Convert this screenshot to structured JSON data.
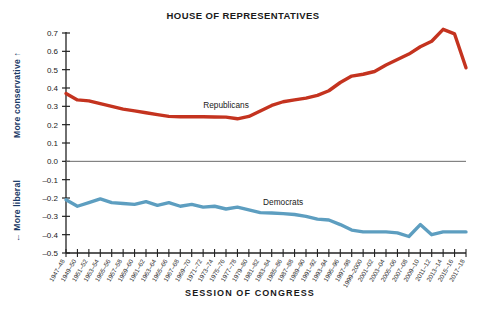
{
  "chart_data": {
    "type": "line",
    "title": "HOUSE OF REPRESENTATIVES",
    "xlabel": "SESSION OF CONGRESS",
    "ylabel_top": "More conservative ↑",
    "ylabel_bottom": "← More liberal",
    "ylim": [
      -0.5,
      0.7
    ],
    "ytick_labels": [
      "0.7",
      "0.6",
      "0.5",
      "0.4",
      "0.3",
      "0.2",
      "0.1",
      "0.0",
      "–0.1",
      "–0.2",
      "–0.3",
      "–0.4",
      "–0.5"
    ],
    "yticks": [
      0.7,
      0.6,
      0.5,
      0.4,
      0.3,
      0.2,
      0.1,
      0.0,
      -0.1,
      -0.2,
      -0.3,
      -0.4,
      -0.5
    ],
    "grid": false,
    "zero_line": true,
    "legend_position": "inline-annotation",
    "categories": [
      "1947–48",
      "1949–50",
      "1951–52",
      "1953–54",
      "1955–56",
      "1957–58",
      "1959–60",
      "1961–62",
      "1963–64",
      "1965–66",
      "1967–68",
      "1969–70",
      "1971–72",
      "1973–74",
      "1975–76",
      "1977–78",
      "1979–80",
      "1981–82",
      "1983–84",
      "1985–86",
      "1987–88",
      "1989–90",
      "1991–92",
      "1993–94",
      "1995–96",
      "1997–98",
      "1999–2000",
      "2001–02",
      "2003–04",
      "2005–06",
      "2007–08",
      "2009–10",
      "2011–12",
      "2013–14",
      "2015–16",
      "2017–18"
    ],
    "series": [
      {
        "name": "Republicans",
        "color": "#C4331F",
        "values": [
          0.37,
          0.335,
          0.33,
          0.315,
          0.3,
          0.285,
          0.275,
          0.265,
          0.255,
          0.245,
          0.243,
          0.243,
          0.243,
          0.242,
          0.241,
          0.232,
          0.245,
          0.275,
          0.305,
          0.325,
          0.335,
          0.345,
          0.36,
          0.385,
          0.43,
          0.465,
          0.475,
          0.49,
          0.525,
          0.555,
          0.585,
          0.625,
          0.655,
          0.72,
          0.695,
          0.51
        ]
      },
      {
        "name": "Democrats",
        "color": "#5D9EC0",
        "values": [
          -0.21,
          -0.245,
          -0.225,
          -0.205,
          -0.225,
          -0.23,
          -0.235,
          -0.22,
          -0.24,
          -0.225,
          -0.245,
          -0.235,
          -0.25,
          -0.245,
          -0.26,
          -0.25,
          -0.265,
          -0.28,
          -0.282,
          -0.285,
          -0.29,
          -0.3,
          -0.315,
          -0.32,
          -0.345,
          -0.375,
          -0.385,
          -0.385,
          -0.385,
          -0.39,
          -0.41,
          -0.345,
          -0.4,
          -0.385,
          -0.385,
          -0.385
        ]
      }
    ],
    "annotations": [
      {
        "text": "Republicans",
        "series": "Republicans"
      },
      {
        "text": "Democrats",
        "series": "Democrats"
      }
    ]
  }
}
